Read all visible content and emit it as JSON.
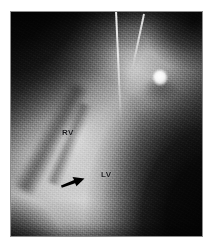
{
  "figure": {
    "type": "medical-radiograph",
    "modality": "cardiac-ventriculogram",
    "alt": "Grayscale radiographic cardiac image showing right and left ventricles separated by the interventricular septum, with a catheter entering from the top and a black arrow indicating a septal defect.",
    "background_color": "#ffffff",
    "border_color": "#8d8d8d"
  },
  "annotations": {
    "rv": {
      "label": "RV",
      "meaning": "right-ventricle",
      "color": "#17171a"
    },
    "lv": {
      "label": "LV",
      "meaning": "left-ventricle",
      "color": "#17171a"
    },
    "arrow": {
      "label": "",
      "meaning": "septal-defect-pointer",
      "direction": "right-upward",
      "color": "#000000"
    }
  },
  "features": {
    "catheter": {
      "name": "catheter-shaft",
      "color": "#ffffff"
    },
    "catheter_tip": {
      "name": "catheter-tip-opacity",
      "color": "#ffffff"
    },
    "septum": {
      "name": "interventricular-septum",
      "color": "#2e2e2e"
    }
  }
}
